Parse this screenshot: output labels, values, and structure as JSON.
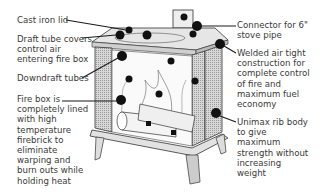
{
  "diagram": {
    "labels": [
      {
        "id": "cast-iron-lid",
        "lines": [
          "Cast iron lid"
        ]
      },
      {
        "id": "draft-tube-covers",
        "lines": [
          "Draft tube covers",
          "control air",
          "entering fire box"
        ]
      },
      {
        "id": "downdraft-tubes",
        "lines": [
          "Downdraft tubes"
        ]
      },
      {
        "id": "fire-box",
        "lines": [
          "Fire box is",
          "completely lined",
          "with high",
          "temperature",
          "firebrick to",
          "eliminate",
          "warping and",
          "burn outs while",
          "holding heat"
        ]
      },
      {
        "id": "connector",
        "lines": [
          "Connector for 6\"",
          "stove pipe"
        ]
      },
      {
        "id": "welded",
        "lines": [
          "Welded air tight",
          "construction for",
          "complete control",
          "of fire and",
          "maximum fuel",
          "economy"
        ]
      },
      {
        "id": "unimax",
        "lines": [
          "Unimax rib body",
          "to give",
          "maximum",
          "strength without",
          "increasing",
          "weight"
        ]
      }
    ],
    "colors": {
      "text": "#3a3a3a",
      "line": "#1a1a1a",
      "panel": "#bdbdbd"
    }
  }
}
